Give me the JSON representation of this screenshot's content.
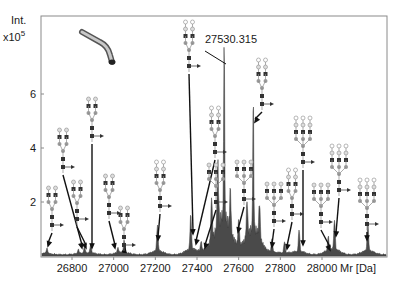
{
  "chart_data": {
    "type": "area",
    "title": "",
    "xlabel": "Mr [Da]",
    "ylabel": "Int.",
    "ylabel_scale": "x10",
    "ylabel_exponent": "5",
    "xlim": [
      26600,
      28300
    ],
    "ylim": [
      0,
      7.6
    ],
    "x_ticks": [
      26800,
      27000,
      27200,
      27400,
      27600,
      27800,
      28000
    ],
    "x_tick_labels": [
      "26800",
      "27000",
      "27200",
      "27400",
      "27600",
      "27800",
      "28000"
    ],
    "y_ticks": [
      2,
      4,
      6
    ],
    "y_tick_labels": [
      "2",
      "4",
      "6"
    ],
    "grid": false,
    "legend": null,
    "fill_color": "#4a4a4a",
    "peaks": [
      {
        "x": 26640,
        "y": 0.25
      },
      {
        "x": 26680,
        "y": 0.2
      },
      {
        "x": 26830,
        "y": 0.15
      },
      {
        "x": 26860,
        "y": 0.2
      },
      {
        "x": 26890,
        "y": 0.3
      },
      {
        "x": 27020,
        "y": 0.2
      },
      {
        "x": 27050,
        "y": 0.45
      },
      {
        "x": 27210,
        "y": 0.95
      },
      {
        "x": 27370,
        "y": 1.3
      },
      {
        "x": 27420,
        "y": 0.35
      },
      {
        "x": 27470,
        "y": 1.6
      },
      {
        "x": 27500,
        "y": 2.3
      },
      {
        "x": 27530.315,
        "y": 7.0
      },
      {
        "x": 27560,
        "y": 1.5
      },
      {
        "x": 27600,
        "y": 0.9
      },
      {
        "x": 27640,
        "y": 1.3
      },
      {
        "x": 27670,
        "y": 5.0
      },
      {
        "x": 27700,
        "y": 1.3
      },
      {
        "x": 27760,
        "y": 0.5
      },
      {
        "x": 27820,
        "y": 0.4
      },
      {
        "x": 27890,
        "y": 0.8
      },
      {
        "x": 28030,
        "y": 0.5
      },
      {
        "x": 28060,
        "y": 1.1
      },
      {
        "x": 28220,
        "y": 1.05
      }
    ],
    "annotations": [
      {
        "text": "27530.315",
        "target_x": 27530.315,
        "target_y": 7.0
      }
    ],
    "glycan_labels": [
      {
        "target_x": 26640,
        "structure": "biantennary-core-fucosylated-G0"
      },
      {
        "target_x": 26830,
        "structure": "biantennary-core-fucosylated-G1"
      },
      {
        "target_x": 26860,
        "structure": "biantennary-core-fucosylated-G1-sialylated"
      },
      {
        "target_x": 26890,
        "structure": "biantennary-core-fucosylated-G2S2"
      },
      {
        "target_x": 27020,
        "structure": "biantennary-core-fucosylated-G1S1"
      },
      {
        "target_x": 27050,
        "structure": "biantennary-core-fucosylated-G2S1"
      },
      {
        "target_x": 27210,
        "structure": "biantennary-core-fucosylated-G2S2"
      },
      {
        "target_x": 27370,
        "structure": "biantennary-core-fucosylated-G2S1"
      },
      {
        "target_x": 27420,
        "structure": "triantennary-core-fucosylated-G3"
      },
      {
        "target_x": 27470,
        "structure": "biantennary-core-fucosylated-G2S2"
      },
      {
        "target_x": 27530.315,
        "structure": "biantennary-core-fucosylated-G2S2"
      },
      {
        "target_x": 27600,
        "structure": "triantennary-core-fucosylated-G3S1"
      },
      {
        "target_x": 27670,
        "structure": "biantennary-core-fucosylated-G2S2"
      },
      {
        "target_x": 27760,
        "structure": "triantennary-core-fucosylated-G3S2"
      },
      {
        "target_x": 27820,
        "structure": "triantennary-core-fucosylated-G3S2"
      },
      {
        "target_x": 27890,
        "structure": "triantennary-core-fucosylated-G3S3"
      },
      {
        "target_x": 28030,
        "structure": "triantennary-core-fucosylated-G3S2"
      },
      {
        "target_x": 28060,
        "structure": "triantennary-core-fucosylated-G3S3"
      },
      {
        "target_x": 28220,
        "structure": "triantennary-core-fucosylated-G3S3"
      }
    ]
  },
  "labels": {
    "y_title": "Int.",
    "y_scale": "x10",
    "y_exp": "5",
    "x_title": "Mr [Da]",
    "peak_annotation": "27530.315"
  },
  "inset": {
    "icon": "antibody-fragment-icon"
  }
}
